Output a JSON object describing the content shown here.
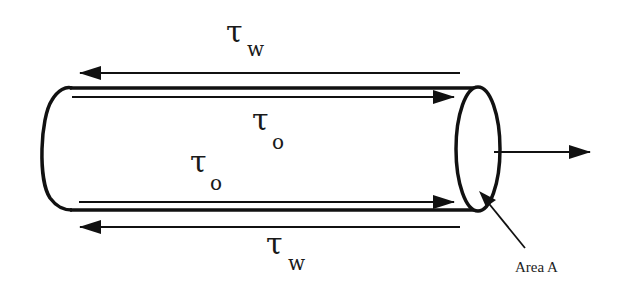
{
  "diagram": {
    "labels": {
      "tau_wall_top": {
        "symbol": "τ",
        "subscript": "w"
      },
      "tau_o_top": {
        "symbol": "τ",
        "subscript": "o"
      },
      "tau_o_bottom": {
        "symbol": "τ",
        "subscript": "o"
      },
      "tau_wall_bottom": {
        "symbol": "τ",
        "subscript": "w"
      },
      "area": "Area A"
    },
    "arrows": [
      {
        "name": "wall-shear-top",
        "direction": "left"
      },
      {
        "name": "fluid-shear-top",
        "direction": "right"
      },
      {
        "name": "fluid-shear-bottom",
        "direction": "right"
      },
      {
        "name": "wall-shear-bottom",
        "direction": "left"
      },
      {
        "name": "normal-force",
        "direction": "right"
      }
    ],
    "colors": {
      "stroke": "#111111",
      "background": "#ffffff"
    }
  }
}
